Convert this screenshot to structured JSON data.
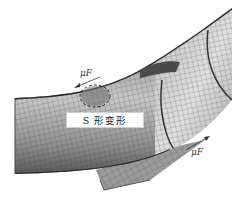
{
  "figure": {
    "annotation_label": "S 形变形",
    "force_labels": {
      "top": "μF",
      "bottom": "μF"
    },
    "colors": {
      "background": "#ffffff",
      "mesh_light": "#d8d8d8",
      "mesh_dark": "#5a5a5a",
      "grid_line": "#3c3c3c",
      "annotation_box": "#ffffff"
    }
  }
}
